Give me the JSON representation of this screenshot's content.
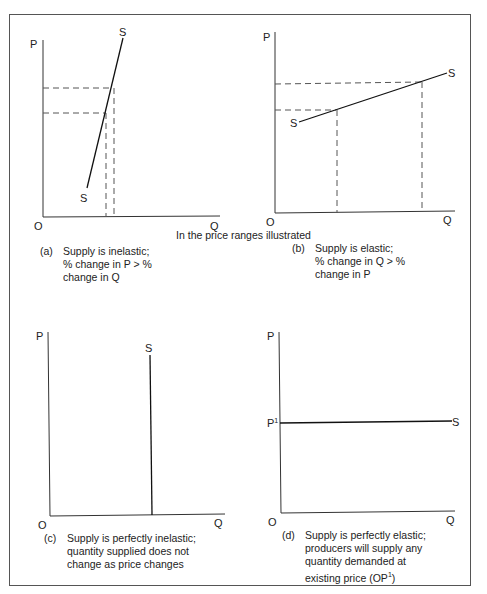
{
  "header_note": "In the price ranges illustrated",
  "panels": [
    {
      "id": "a",
      "tag": "(a)",
      "caption_lines": [
        "Supply is inelastic;",
        "% change in P > %",
        "change in Q"
      ],
      "axis": {
        "y_label": "P",
        "x_label": "Q",
        "origin_label": "O"
      },
      "curve_label_start": "S",
      "curve_label_end": "S",
      "type": "steep-upward-supply"
    },
    {
      "id": "b",
      "tag": "(b)",
      "caption_lines": [
        "Supply is elastic;",
        "% change in Q > %",
        "change in P"
      ],
      "axis": {
        "y_label": "P",
        "x_label": "Q",
        "origin_label": "O"
      },
      "curve_label_start": "S",
      "curve_label_end": "S",
      "type": "shallow-upward-supply"
    },
    {
      "id": "c",
      "tag": "(c)",
      "caption_lines": [
        "Supply is perfectly inelastic;",
        "quantity supplied does not",
        "change as price changes"
      ],
      "axis": {
        "y_label": "P",
        "x_label": "Q",
        "origin_label": "O"
      },
      "curve_label_end": "S",
      "type": "vertical-supply"
    },
    {
      "id": "d",
      "tag": "(d)",
      "caption_lines": [
        "Supply is perfectly elastic;",
        "producers will supply any",
        "quantity demanded at",
        "existing price (OP"
      ],
      "caption_sup": "1",
      "caption_tail": ")",
      "axis": {
        "y_label": "P",
        "x_label": "Q",
        "origin_label": "O",
        "price_label": "P",
        "price_sup": "1"
      },
      "curve_label_end": "S",
      "type": "horizontal-supply"
    }
  ]
}
